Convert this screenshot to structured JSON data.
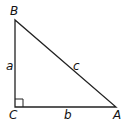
{
  "diagram": {
    "type": "right-triangle",
    "vertices": {
      "B": {
        "label": "B",
        "x": 15,
        "y": 20
      },
      "C": {
        "label": "C",
        "x": 15,
        "y": 107
      },
      "A": {
        "label": "A",
        "x": 116,
        "y": 107
      }
    },
    "sides": {
      "a": {
        "label": "a",
        "between": [
          "B",
          "C"
        ]
      },
      "b": {
        "label": "b",
        "between": [
          "C",
          "A"
        ]
      },
      "c": {
        "label": "c",
        "between": [
          "B",
          "A"
        ]
      }
    },
    "right_angle_at": "C",
    "line_color": "#222222"
  }
}
